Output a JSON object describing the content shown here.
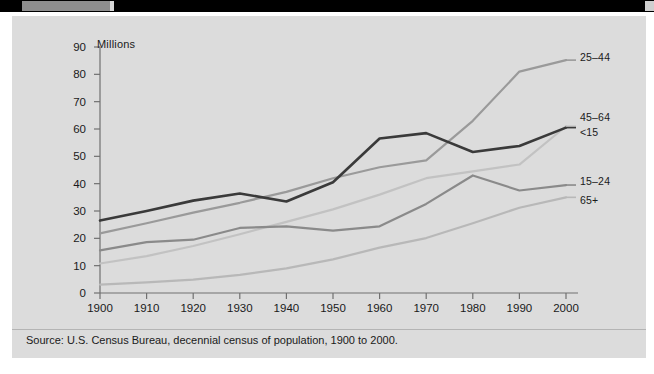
{
  "chart_data": {
    "type": "line",
    "title": "",
    "xlabel": "",
    "ylabel": "Millions",
    "x": [
      1900,
      1910,
      1920,
      1930,
      1940,
      1950,
      1960,
      1970,
      1980,
      1990,
      2000
    ],
    "xlim": [
      1900,
      2000
    ],
    "ylim": [
      0,
      90
    ],
    "xticks": [
      "1900",
      "1910",
      "1920",
      "1930",
      "1940",
      "1950",
      "1960",
      "1970",
      "1980",
      "1990",
      "2000"
    ],
    "yticks": [
      "0",
      "10",
      "20",
      "30",
      "40",
      "50",
      "60",
      "70",
      "80",
      "90"
    ],
    "grid": false,
    "legend_position": "right-end-labels",
    "series": [
      {
        "name": "<15",
        "color": "#3a3a3a",
        "width": 2.6,
        "values": [
          26.5,
          30.0,
          33.8,
          36.4,
          33.5,
          40.5,
          56.5,
          58.5,
          51.6,
          53.8,
          60.5
        ]
      },
      {
        "name": "25-44",
        "color": "#9a9a9a",
        "width": 2.2,
        "values": [
          21.8,
          25.5,
          29.4,
          33.0,
          37.0,
          42.0,
          46.0,
          48.5,
          63.0,
          81.0,
          85.2
        ]
      },
      {
        "name": "15-24",
        "color": "#8a8a8a",
        "width": 2.2,
        "values": [
          15.6,
          18.6,
          19.5,
          23.8,
          24.4,
          22.8,
          24.4,
          32.6,
          43.0,
          37.5,
          39.5
        ]
      },
      {
        "name": "45-64",
        "color": "#c2c2c2",
        "width": 2.2,
        "values": [
          10.8,
          13.5,
          17.2,
          21.5,
          26.0,
          30.6,
          36.0,
          42.0,
          44.5,
          47.0,
          61.0
        ]
      },
      {
        "name": "65+",
        "color": "#b8b8b8",
        "width": 2.2,
        "values": [
          3.1,
          3.9,
          4.9,
          6.6,
          9.0,
          12.3,
          16.6,
          20.1,
          25.5,
          31.2,
          35.0
        ]
      }
    ],
    "annotations": [
      {
        "text": "25-44",
        "value": 85.2,
        "year": 2000
      },
      {
        "text": "45-64",
        "value": 61.0,
        "year": 2000
      },
      {
        "text": "<15",
        "value": 60.5,
        "year": 2000
      },
      {
        "text": "15-24",
        "value": 39.5,
        "year": 2000
      },
      {
        "text": "65+",
        "value": 35.0,
        "year": 2000
      }
    ]
  },
  "axis": {
    "y_title": "Millions"
  },
  "labels": {
    "s_25_44": "25–44",
    "s_45_64": "45–64",
    "s_lt15": "<15",
    "s_15_24": "15–24",
    "s_65plus": "65+"
  },
  "footer": {
    "source": "Source: U.S. Census Bureau, decennial census of population, 1900 to 2000."
  },
  "colors": {
    "panel_bg": "#dcdcdc",
    "axis": "#707070",
    "text": "#1a1a1a",
    "dark_series": "#3a3a3a",
    "mid_series": "#9a9a9a",
    "light_series": "#c2c2c2"
  }
}
